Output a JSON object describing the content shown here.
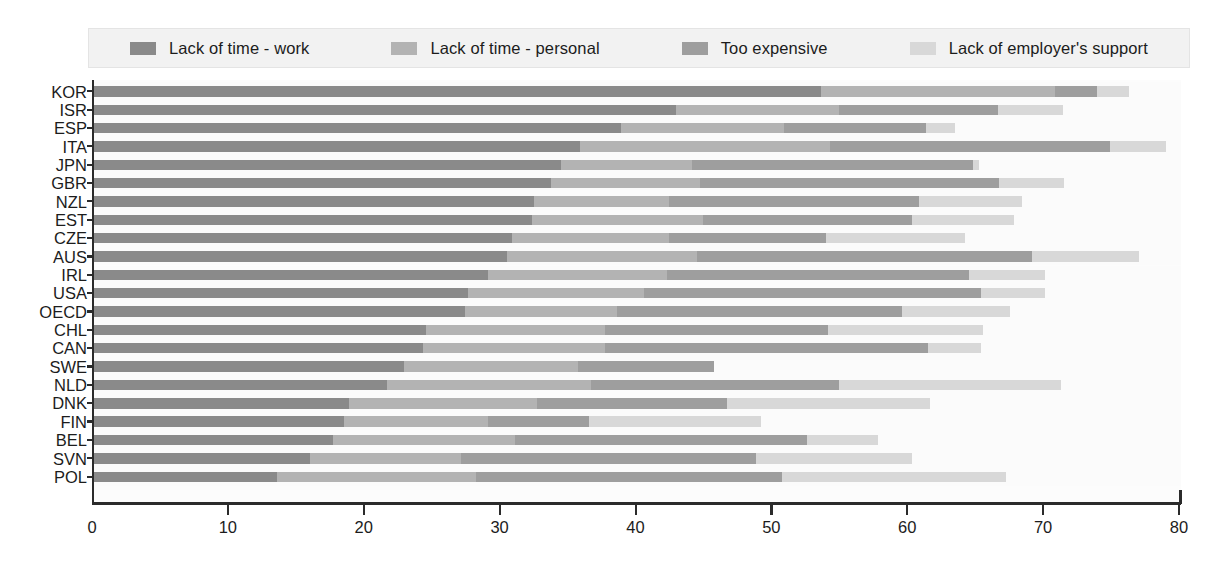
{
  "legend": {
    "items": [
      {
        "label": "Lack of time - work",
        "color": "#8a8a8a"
      },
      {
        "label": "Lack of time - personal",
        "color": "#b3b3b3"
      },
      {
        "label": "Too expensive",
        "color": "#9e9e9e"
      },
      {
        "label": "Lack of employer's support",
        "color": "#d8d8d8"
      }
    ]
  },
  "axis": {
    "x_ticks": [
      "0",
      "10",
      "20",
      "30",
      "40",
      "50",
      "60",
      "70",
      "80"
    ]
  },
  "chart_data": {
    "type": "bar",
    "orientation": "horizontal",
    "stacked": true,
    "title": "",
    "xlabel": "",
    "ylabel": "",
    "xlim": [
      0,
      80
    ],
    "grid": false,
    "legend_position": "top",
    "categories": [
      "KOR",
      "ISR",
      "ESP",
      "ITA",
      "JPN",
      "GBR",
      "NZL",
      "EST",
      "CZE",
      "AUS",
      "IRL",
      "USA",
      "OECD",
      "CHL",
      "CAN",
      "SWE",
      "NLD",
      "DNK",
      "FIN",
      "BEL",
      "SVN",
      "POL"
    ],
    "series": [
      {
        "name": "Lack of time - work",
        "color": "#8a8a8a",
        "values": [
          53.5,
          42.8,
          38.8,
          35.8,
          34.4,
          33.6,
          32.4,
          32.2,
          30.8,
          30.4,
          29.0,
          27.5,
          27.3,
          24.4,
          24.2,
          22.8,
          21.6,
          18.8,
          18.4,
          17.6,
          15.9,
          13.5
        ]
      },
      {
        "name": "Lack of time - personal",
        "color": "#b3b3b3",
        "values": [
          17.2,
          12.0,
          12.0,
          18.4,
          9.6,
          11.0,
          9.9,
          12.6,
          11.5,
          14.0,
          13.2,
          13.0,
          11.2,
          13.2,
          13.4,
          12.8,
          15.0,
          13.8,
          10.6,
          13.4,
          11.1,
          14.6
        ]
      },
      {
        "name": "Too expensive",
        "color": "#9e9e9e",
        "values": [
          3.1,
          11.7,
          10.4,
          20.6,
          20.7,
          22.0,
          18.4,
          15.4,
          11.6,
          24.6,
          22.2,
          24.8,
          21.0,
          16.4,
          23.8,
          10.0,
          18.2,
          14.0,
          7.4,
          21.5,
          21.7,
          22.5
        ]
      },
      {
        "name": "Lack of employer's support",
        "color": "#d8d8d8",
        "values": [
          2.4,
          4.8,
          2.2,
          4.1,
          0.4,
          4.8,
          7.6,
          7.5,
          10.2,
          7.9,
          5.6,
          4.7,
          7.9,
          11.4,
          3.9,
          0.0,
          16.4,
          14.9,
          12.7,
          5.2,
          11.5,
          16.5
        ]
      }
    ],
    "totals": [
      76.2,
      71.3,
      63.4,
      78.9,
      65.1,
      71.4,
      68.3,
      67.7,
      64.1,
      76.9,
      70.0,
      70.0,
      67.4,
      65.4,
      65.3,
      45.6,
      71.2,
      61.5,
      49.1,
      57.7,
      60.2,
      67.1
    ]
  }
}
